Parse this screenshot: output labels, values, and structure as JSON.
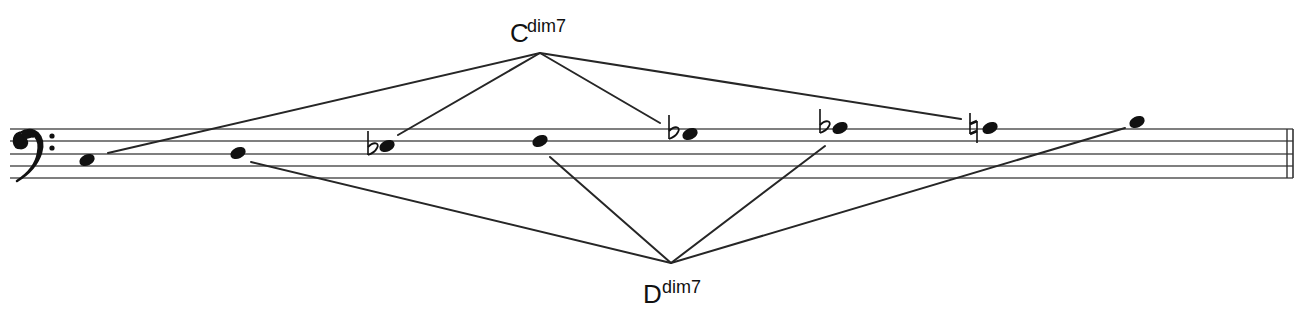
{
  "diagram": {
    "clef": "bass",
    "staff": {
      "x_start": 10,
      "x_end": 1293,
      "lines_y": [
        129,
        141,
        154,
        166,
        178
      ],
      "final_barline": true
    },
    "notes": [
      {
        "name": "C3",
        "accidental": "",
        "x": 87,
        "y": 160,
        "chord": "D"
      },
      {
        "name": "D3",
        "accidental": "",
        "x": 238,
        "y": 153,
        "chord": "D"
      },
      {
        "name": "Eb3",
        "accidental": "flat",
        "x": 387,
        "y": 146,
        "chord": "C"
      },
      {
        "name": "F3",
        "accidental": "",
        "x": 540,
        "y": 141,
        "chord": "D"
      },
      {
        "name": "Gb3",
        "accidental": "flat",
        "x": 690,
        "y": 134,
        "chord": "C"
      },
      {
        "name": "Ab3",
        "accidental": "flat",
        "x": 840,
        "y": 128,
        "chord": "D"
      },
      {
        "name": "A3",
        "accidental": "natural",
        "x": 990,
        "y": 128,
        "chord": "C"
      },
      {
        "name": "B3",
        "accidental": "",
        "x": 1137,
        "y": 122,
        "chord": "D"
      }
    ],
    "chords": [
      {
        "id": "C",
        "root": "C",
        "quality": "dim7",
        "label_x": 510,
        "label_y": 42,
        "apex": [
          540,
          53
        ],
        "targets": [
          [
            108,
            153
          ],
          [
            398,
            135
          ],
          [
            660,
            123
          ],
          [
            961,
            119
          ]
        ]
      },
      {
        "id": "D",
        "root": "D",
        "quality": "dim7",
        "label_x": 643,
        "label_y": 303,
        "apex": [
          671,
          263
        ],
        "targets": [
          [
            251,
            162
          ],
          [
            550,
            157
          ],
          [
            825,
            146
          ],
          [
            1125,
            128
          ]
        ]
      }
    ]
  }
}
